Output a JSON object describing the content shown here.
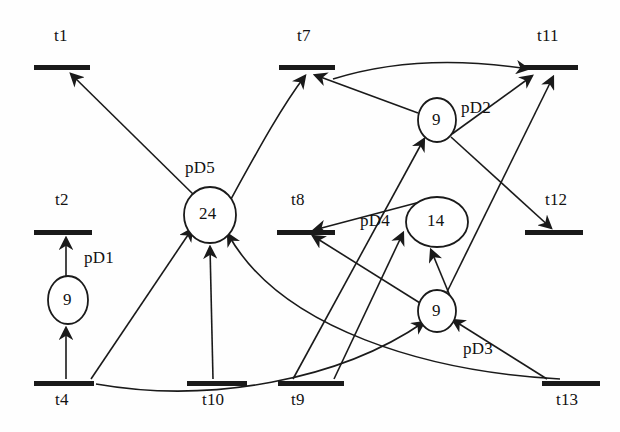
{
  "diagram": {
    "kind": "petri-net",
    "title": "",
    "stroke_color": "#1a1a1a",
    "fill_color": "#ffffff",
    "transitions": [
      {
        "id": "t1",
        "label": "t1",
        "x": 62,
        "y": 68,
        "w": 56,
        "label_x": 54,
        "label_y": 28
      },
      {
        "id": "t2",
        "label": "t2",
        "x": 63,
        "y": 232,
        "w": 58,
        "label_x": 55,
        "label_y": 192
      },
      {
        "id": "t4",
        "label": "t4",
        "x": 64,
        "y": 383,
        "w": 60,
        "label_x": 55,
        "label_y": 392
      },
      {
        "id": "t7",
        "label": "t7",
        "x": 307,
        "y": 68,
        "w": 56,
        "label_x": 297,
        "label_y": 28
      },
      {
        "id": "t8",
        "label": "t8",
        "x": 306,
        "y": 232,
        "w": 58,
        "label_x": 291,
        "label_y": 192
      },
      {
        "id": "t9",
        "label": "t9",
        "x": 311,
        "y": 383,
        "w": 66,
        "label_x": 291,
        "label_y": 392
      },
      {
        "id": "t10",
        "label": "t10",
        "x": 217,
        "y": 383,
        "w": 60,
        "label_x": 202,
        "label_y": 392
      },
      {
        "id": "t11",
        "label": "t11",
        "x": 549,
        "y": 68,
        "w": 58,
        "label_x": 537,
        "label_y": 28
      },
      {
        "id": "t12",
        "label": "t12",
        "x": 554,
        "y": 232,
        "w": 58,
        "label_x": 545,
        "label_y": 192
      },
      {
        "id": "t13",
        "label": "t13",
        "x": 571,
        "y": 383,
        "w": 58,
        "label_x": 556,
        "label_y": 392
      }
    ],
    "places": [
      {
        "id": "pD1",
        "label": "pD1",
        "tokens": "9",
        "cx": 68,
        "cy": 300,
        "rx": 20,
        "ry": 24,
        "label_x": 84,
        "label_y": 250
      },
      {
        "id": "pD5",
        "label": "pD5",
        "tokens": "24",
        "cx": 210,
        "cy": 215,
        "rx": 26,
        "ry": 28,
        "label_x": 185,
        "label_y": 160
      },
      {
        "id": "pD2",
        "label": "pD2",
        "tokens": "9",
        "cx": 437,
        "cy": 120,
        "rx": 19,
        "ry": 22,
        "label_x": 461,
        "label_y": 100
      },
      {
        "id": "pD4",
        "label": "pD4",
        "tokens": "14",
        "cx": 437,
        "cy": 222,
        "rx": 31,
        "ry": 25,
        "label_x": 362,
        "label_y": 212
      },
      {
        "id": "pD3",
        "label": "pD3",
        "tokens": "9",
        "cx": 437,
        "cy": 311,
        "rx": 19,
        "ry": 21,
        "label_x": 463,
        "label_y": 341
      }
    ],
    "arcs": [
      {
        "from": "pD5",
        "to": "t1",
        "name": "arc-pD5-t1"
      },
      {
        "from": "t4",
        "to": "pD1",
        "name": "arc-t4-pD1"
      },
      {
        "from": "pD1",
        "to": "t2",
        "name": "arc-pD1-t2"
      },
      {
        "from": "t4",
        "to": "pD5",
        "name": "arc-t4-pD5"
      },
      {
        "from": "t10",
        "to": "pD5",
        "name": "arc-t10-pD5"
      },
      {
        "from": "pD5",
        "to": "t7",
        "name": "arc-pD5-t7"
      },
      {
        "from": "t13",
        "to": "pD5",
        "name": "arc-t13-pD5"
      },
      {
        "from": "pD2",
        "to": "t7",
        "name": "arc-pD2-t7"
      },
      {
        "from": "t9",
        "to": "pD2",
        "name": "arc-t9-pD2"
      },
      {
        "from": "pD2",
        "to": "t11",
        "name": "arc-pD2-t11"
      },
      {
        "from": "pD2",
        "to": "t12",
        "name": "arc-pD2-t12"
      },
      {
        "from": "t7",
        "to": "t11",
        "name": "arc-t7-t11"
      },
      {
        "from": "t9",
        "to": "pD4",
        "name": "arc-t9-pD4"
      },
      {
        "from": "pD4",
        "to": "t8",
        "name": "arc-pD4-t8"
      },
      {
        "from": "pD3",
        "to": "pD4",
        "name": "arc-pD3-pD4"
      },
      {
        "from": "pD3",
        "to": "t8",
        "name": "arc-pD3-t8"
      },
      {
        "from": "pD3",
        "to": "t11",
        "name": "arc-pD3-t11"
      },
      {
        "from": "t13",
        "to": "pD3",
        "name": "arc-t13-pD3"
      },
      {
        "from": "t4",
        "to": "pD3",
        "name": "arc-t4-pD3"
      }
    ]
  }
}
